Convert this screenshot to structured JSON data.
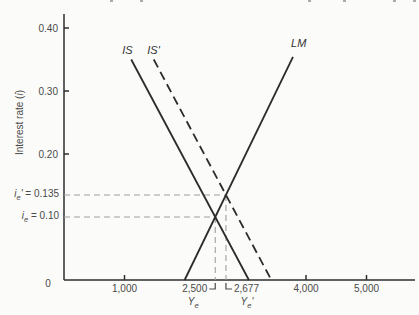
{
  "figure": {
    "ylabel_parts": {
      "prefix": "Interest rate (",
      "var": "i",
      "suffix": ")"
    },
    "eq_labels": {
      "i_e_prime": {
        "var": "i",
        "sub": "e",
        "prime": "'",
        "rest": " = 0.135"
      },
      "i_e": {
        "var": "i",
        "sub": "e",
        "prime": "",
        "rest": " = 0.10"
      },
      "y_e": {
        "var": "Y",
        "sub": "e",
        "prime": ""
      },
      "y_e_prime": {
        "var": "Y",
        "sub": "e",
        "prime": "'"
      }
    }
  },
  "chart_data": {
    "type": "line",
    "title": "",
    "xlabel": "",
    "ylabel": "Interest rate (i)",
    "xlim": [
      0,
      5800
    ],
    "ylim": [
      0,
      0.42
    ],
    "grid": false,
    "legend": "labels-on-curves",
    "x_ticks": [
      {
        "value": 1000,
        "label": "1,000"
      },
      {
        "value": 4000,
        "label": "4,000"
      },
      {
        "value": 5000,
        "label": "5,000"
      }
    ],
    "y_ticks": [
      {
        "value": 0.4,
        "label": "0.40"
      },
      {
        "value": 0.3,
        "label": "0.30"
      },
      {
        "value": 0.2,
        "label": "0.20"
      }
    ],
    "origin_label": "0",
    "series": [
      {
        "name": "IS",
        "style": "solid",
        "points": [
          [
            1111,
            0.35
          ],
          [
            3056,
            0
          ]
        ],
        "label_pos": [
          1050,
          0.358
        ]
      },
      {
        "name": "IS'",
        "style": "dashed",
        "points": [
          [
            1483,
            0.35
          ],
          [
            3427,
            0
          ]
        ],
        "label_pos": [
          1480,
          0.358
        ]
      },
      {
        "name": "LM",
        "style": "solid",
        "points": [
          [
            1994,
            0
          ],
          [
            3785,
            0.354
          ]
        ],
        "label_pos": [
          3880,
          0.37
        ]
      }
    ],
    "equilibria": [
      {
        "name": "E",
        "x": 2500,
        "y": 0.1,
        "x_label": "2,500",
        "bracket": "left",
        "y_value_label": "ie = 0.10",
        "x_value_label": "Ye"
      },
      {
        "name": "E'",
        "x": 2677,
        "y": 0.135,
        "x_label": "2,677",
        "bracket": "right",
        "y_value_label": "ie' = 0.135",
        "x_value_label": "Ye'"
      }
    ],
    "colors": {
      "curve": "#2b2b2b",
      "guide": "#a0a0a0",
      "text": "#4a4a4a",
      "background": "#fbfbf9"
    }
  },
  "scan_artifacts": {
    "dot_xs": [
      110,
      140,
      308,
      343,
      393,
      413
    ]
  }
}
